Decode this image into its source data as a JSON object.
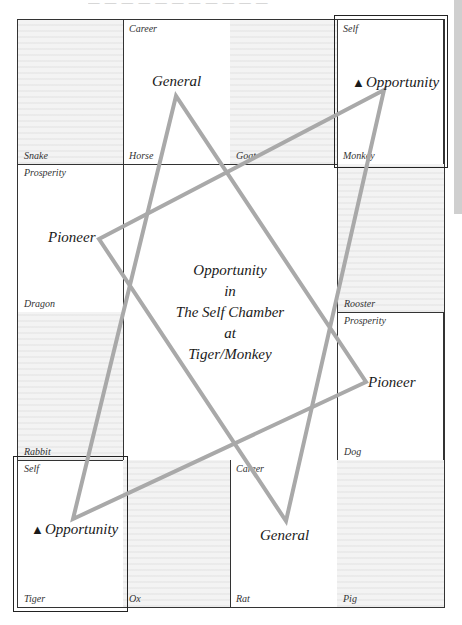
{
  "page": {
    "header_fragment": "— — —  — — — — — — — —"
  },
  "grid": {
    "rows": [
      [
        {
          "palace": "Snake",
          "chamber": "",
          "shaded": true
        },
        {
          "palace": "Horse",
          "chamber": "Career",
          "shaded": false
        },
        {
          "palace": "Goat",
          "chamber": "",
          "shaded": true
        },
        {
          "palace": "Monkey",
          "chamber": "Self",
          "shaded": false
        }
      ],
      [
        {
          "palace": "Dragon",
          "chamber": "Prosperity",
          "shaded": false
        },
        {
          "palace": "Rooster",
          "chamber": "",
          "shaded": true
        }
      ],
      [
        {
          "palace": "Rabbit",
          "chamber": "",
          "shaded": true
        },
        {
          "palace": "Dog",
          "chamber": "Prosperity",
          "shaded": false
        }
      ],
      [
        {
          "palace": "Tiger",
          "chamber": "Self",
          "shaded": false
        },
        {
          "palace": "Ox",
          "chamber": "",
          "shaded": true
        },
        {
          "palace": "Rat",
          "chamber": "Career",
          "shaded": false
        },
        {
          "palace": "Pig",
          "chamber": "",
          "shaded": true
        }
      ]
    ]
  },
  "center": {
    "line1": "Opportunity",
    "line2": "in",
    "line3": "The Self Chamber",
    "line4": "at",
    "line5": "Tiger/Monkey"
  },
  "stars": {
    "general_top": "General",
    "general_bottom": "General",
    "pioneer_left": "Pioneer",
    "pioneer_right": "Pioneer",
    "opportunity_monkey": "Opportunity",
    "opportunity_tiger": "Opportunity",
    "opportunity_marker": "▲"
  },
  "triangles": {
    "color": "#a9a9a9",
    "triangle_1": {
      "vertices": "General (Horse) – Opportunity (Tiger) – Pioneer (Dog)"
    },
    "triangle_2": {
      "vertices": "Pioneer (Dragon) – Opportunity (Monkey) – General (Rat)"
    }
  }
}
